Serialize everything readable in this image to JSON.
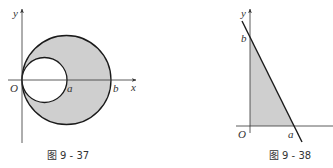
{
  "figures": [
    {
      "id": "fig-9-37",
      "caption": "图 9 - 37",
      "axis_labels": {
        "x": "x",
        "y": "y",
        "origin": "O"
      },
      "point_labels": {
        "a": "a",
        "b": "b"
      },
      "shapes": {
        "outer_circle": "circle through O and b, shaded",
        "inner_circle": "circle through O and a, unshaded"
      },
      "colors": {
        "fill": "#cfcfcf",
        "stroke": "#1a1a1a"
      }
    },
    {
      "id": "fig-9-38",
      "caption": "图 9 - 38",
      "axis_labels": {
        "y": "y",
        "origin": "O"
      },
      "point_labels": {
        "a": "a",
        "b": "b"
      },
      "shapes": {
        "line": "line through b on y-axis and a on x-axis",
        "region": "shaded triangle O-a-b"
      },
      "colors": {
        "fill": "#cfcfcf",
        "stroke": "#1a1a1a"
      }
    }
  ]
}
